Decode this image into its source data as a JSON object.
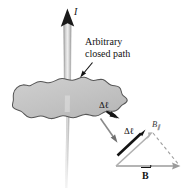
{
  "figure": {
    "name": "amperes-law-arbitrary-closed-path",
    "background_color": "#ffffff"
  },
  "labels": {
    "current": "I",
    "closed_path_line1": "Arbitrary",
    "closed_path_line2": "closed path",
    "delta_l_on_path": "Δℓ",
    "delta_l_in_triangle": "Δℓ",
    "b_parallel": "B",
    "b_parallel_subscript": "∥",
    "b_field": "B"
  },
  "colors": {
    "wire_fill": "#b9b9b9",
    "wire_edge": "#8d8d8d",
    "blob_fill": "#c4c4c4",
    "blob_edge": "#5a5a5a",
    "arrow_black": "#121212",
    "arrow_gray": "#8e8e8e",
    "dashed_gray": "#9a9a9a",
    "text": "#121212"
  },
  "elements": {
    "current_arrow": "vertical-up-arrow-current-I",
    "wire": "vertical-current-carrying-wire",
    "blob": "irregular-closed-loop-amperian-path",
    "pointer_to_path": "leader-arrow-from-label-to-path",
    "pointer_to_triangle": "leader-arrow-from-path-to-vector-triangle",
    "delta_l_segment_arrow": "small-black-tangent-arrow-on-path",
    "triangle_delta_l": "black-delta-l-vector",
    "triangle_b_parallel": "gray-b-parallel-vector",
    "triangle_b": "gray-b-field-vector",
    "triangle_dashed": "dashed-projection-line"
  }
}
